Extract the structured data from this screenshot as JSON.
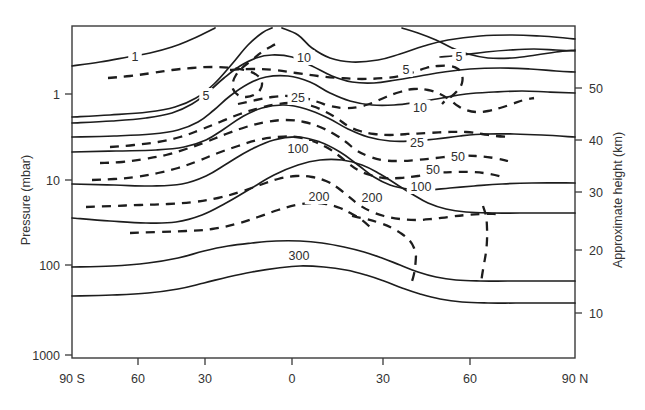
{
  "chart_data": {
    "type": "line",
    "title": "",
    "subtitle": "",
    "xlabel": "",
    "ylabel": "Pressure (mbar)",
    "y2label": "Approximate height (km)",
    "grid": false,
    "legend": "none",
    "x_axis": {
      "label": "",
      "tick_labels": [
        "90 S",
        "60",
        "30",
        "0",
        "30",
        "60",
        "90 N"
      ],
      "tick_values": [
        -90,
        -60,
        -30,
        0,
        30,
        60,
        90
      ],
      "range": [
        -90,
        90
      ],
      "description": "Latitude"
    },
    "y_axis": {
      "label": "Pressure (mbar)",
      "scale": "log",
      "inverted": true,
      "tick_labels": [
        "1",
        "10",
        "100",
        "1000"
      ],
      "tick_values": [
        1,
        10,
        100,
        1000
      ],
      "range": [
        0.3,
        1000
      ]
    },
    "y2_axis": {
      "label": "Approximate height (km)",
      "tick_labels": [
        "50",
        "40",
        "30",
        "20",
        "10"
      ],
      "tick_values": [
        50,
        40,
        30,
        20,
        10
      ],
      "range": [
        8,
        58
      ]
    },
    "contour_styles": {
      "solid": "zonal mean temperature / solid contours",
      "dashed": "zonal mean wind / dashed contours"
    },
    "contour_labels": [
      {
        "text": "1",
        "style": "solid",
        "x": 135,
        "y": 58
      },
      {
        "text": "5",
        "style": "dashed",
        "x": 206,
        "y": 97
      },
      {
        "text": "10",
        "style": "solid",
        "x": 304,
        "y": 59
      },
      {
        "text": "25",
        "style": "solid",
        "x": 298,
        "y": 99
      },
      {
        "text": "5",
        "style": "solid",
        "x": 459,
        "y": 58
      },
      {
        "text": "5",
        "style": "dashed",
        "x": 406,
        "y": 71
      },
      {
        "text": "10",
        "style": "dashed",
        "x": 420,
        "y": 109
      },
      {
        "text": "100",
        "style": "solid",
        "x": 298,
        "y": 150
      },
      {
        "text": "25",
        "style": "dashed",
        "x": 417,
        "y": 144
      },
      {
        "text": "50",
        "style": "solid",
        "x": 458,
        "y": 158
      },
      {
        "text": "50",
        "style": "dashed",
        "x": 433,
        "y": 171
      },
      {
        "text": "100",
        "style": "dashed",
        "x": 421,
        "y": 188
      },
      {
        "text": "200",
        "style": "dashed",
        "x": 319,
        "y": 198
      },
      {
        "text": "200",
        "style": "dashed",
        "x": 372,
        "y": 199
      },
      {
        "text": "300",
        "style": "solid",
        "x": 299,
        "y": 257
      }
    ],
    "solid_contours": [
      {
        "label": "1",
        "points": "72,66 100,62 128,57 150,53 172,47 190,40 205,33 215,28"
      },
      {
        "label": "10a",
        "points": "72,117 110,115 148,112 175,107 196,98 214,84 232,64 248,45 262,33 272,28"
      },
      {
        "label": "10",
        "points": "282,28 298,35 312,48 330,58 352,62 378,60 400,54 424,46 448,40 480,36 512,35 540,36 565,38 575,39"
      },
      {
        "label": "5t",
        "points": "402,28 418,33 436,40 452,48 468,54 488,58 512,58 536,55 556,52 575,50"
      },
      {
        "label": "5r",
        "points": "440,57 462,55 486,52 510,50 534,49 556,50 575,51"
      },
      {
        "label": "L1",
        "points": "72,123 112,121 146,118 172,113 192,104 208,92 224,78 240,66 256,58 272,55 292,57 312,66 332,76 352,82 374,83 396,80 420,76 444,72 470,69 500,68 530,69 556,71 575,72"
      },
      {
        "label": "L2",
        "points": "72,137 114,136 152,134 178,130 198,122 214,110 230,96 248,84 266,77 288,76 310,82 330,93 350,101 372,105 394,105 418,102 442,98 466,94 494,92 522,91 548,92 575,93"
      },
      {
        "label": "L3",
        "points": "72,152 116,151 156,150 184,147 206,140 224,129 242,117 262,108 284,105 306,109 328,118 348,129 368,137 390,141 412,141 436,139 460,136 486,134 514,134 542,135 575,137"
      },
      {
        "label": "L4",
        "points": "72,184 114,185 152,186 182,184 206,176 228,163 250,150 274,140 298,137 320,142 340,152 358,165 374,177 390,185 408,189 428,190 450,188 474,186 502,184 532,183 575,183"
      },
      {
        "label": "L5",
        "points": "72,218 110,221 146,223 176,222 202,215 226,203 250,189 274,175 298,165 320,160 342,160 362,165 380,174 396,184 412,194 428,203 446,209 466,212 492,213 520,213 548,213 575,213"
      },
      {
        "label": "L6",
        "points": "72,267 112,266 148,263 178,258 204,251 228,246 252,243 276,241 300,241 322,243 344,247 364,252 382,258 400,265 418,272 436,277 456,280 480,281 508,281 538,281 575,281"
      },
      {
        "label": "L7",
        "points": "72,296 112,295 148,293 178,289 204,283 228,277 252,272 278,268 300,266 324,267 346,270 366,275 384,281 402,288 420,294 440,299 462,302 488,303 516,303 546,303 575,303"
      }
    ],
    "dashed_contours": [
      {
        "label": "5",
        "points": "108,78 130,76 152,73 172,70 192,68 212,67 232,68 248,71 258,76 262,83 260,90 254,95 246,97 238,95 233,89 233,82 236,75 242,68 252,60 262,52 272,46 280,42"
      },
      {
        "label": "5b",
        "points": "230,70 252,69 274,70 296,73 318,76 340,78 362,79 384,78 400,76 414,72 426,68 438,66 450,66 458,69 462,75 462,83 458,90 452,96 446,100 442,104"
      },
      {
        "label": "10d",
        "points": "238,104 256,100 272,97 288,96 304,98 318,102 330,106 344,108 358,107 372,103 386,97 400,92 414,89 428,90 440,94 450,100 458,106 466,110 476,112 488,111 500,108 512,104 524,100 534,98"
      },
      {
        "label": "25d",
        "points": "110,147 134,145 158,142 180,137 200,130 220,122 240,114 260,108 278,104 296,103 312,106 326,112 338,119 348,126 360,131 374,134 390,135 408,134 428,133 448,132 466,132 482,134 496,136 510,137"
      },
      {
        "label": "25b",
        "points": "100,163 122,162 144,159 166,155 186,149 206,142 226,134 246,127 266,122 286,120 304,122 320,127 334,134 346,142 356,150 368,156 382,160 398,161 416,160 436,158 456,156 476,156 494,158 508,161"
      },
      {
        "label": "50d",
        "points": "92,180 114,179 136,177 158,173 178,168 198,161 218,153 238,146 258,140 278,137 296,137 312,141 326,147 338,155 348,163 358,170 370,175 384,178 400,178 418,176 436,173 454,172 472,172 490,174 506,178"
      },
      {
        "label": "100d",
        "points": "86,207 112,206 140,205 168,204 194,202 218,198 240,192 260,185 278,179 296,176 312,177 326,181 338,188 348,196 358,204 370,211 384,216 400,219 416,220 432,219 448,217 466,215 482,214 496,214"
      },
      {
        "label": "200d",
        "points": "130,233 158,232 186,231 212,229 236,224 258,217 278,210 296,205 312,203 326,204 340,208 352,214 362,220 370,227"
      },
      {
        "label": "200b",
        "points": "352,216 366,219 380,223 392,228 402,234 410,241 414,248 416,256"
      },
      {
        "label": "v1",
        "points": "416,256 415,268 413,278 410,286"
      },
      {
        "label": "v2",
        "points": "483,206 486,216 487,228 487,240 486,252 484,264 482,276 481,284"
      }
    ]
  },
  "axes": {
    "left_title": "Pressure (mbar)",
    "right_title": "Approximate height (km)",
    "left_ticks": [
      {
        "label": "1",
        "y": 94
      },
      {
        "label": "10",
        "y": 180
      },
      {
        "label": "100",
        "y": 265
      },
      {
        "label": "1000",
        "y": 355
      }
    ],
    "right_ticks": [
      {
        "label": "50",
        "y": 88
      },
      {
        "label": "40",
        "y": 140
      },
      {
        "label": "30",
        "y": 192
      },
      {
        "label": "20",
        "y": 250
      },
      {
        "label": "10",
        "y": 313
      }
    ],
    "bottom_ticks": [
      {
        "label": "90 S",
        "x": 72
      },
      {
        "label": "60",
        "x": 138
      },
      {
        "label": "30",
        "x": 205
      },
      {
        "label": "0",
        "x": 292
      },
      {
        "label": "30",
        "x": 383
      },
      {
        "label": "60",
        "x": 470
      },
      {
        "label": "90 N",
        "x": 575
      }
    ]
  }
}
